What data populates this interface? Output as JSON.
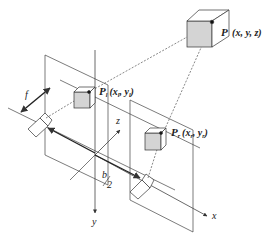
{
  "diagram": {
    "point": {
      "name": "P",
      "coords": "(x, y, z)"
    },
    "left_image_point": {
      "name": "P",
      "sub": "l",
      "coords_open": "(x",
      "coords_mid": ", y",
      "coords_close": ")",
      "sub_x": "l",
      "sub_y": "l"
    },
    "right_image_point": {
      "name": "P",
      "sub": "r",
      "coords_open": "(x",
      "coords_mid": ", y",
      "coords_close": ")",
      "sub_x": "r",
      "sub_y": "r"
    },
    "labels": {
      "focal": "f",
      "baseline_num": "b",
      "baseline_den": "2",
      "axis_x": "x",
      "axis_y": "y",
      "axis_z": "z"
    },
    "colors": {
      "line": "#333333",
      "cube_face": "#d4d4d4",
      "background": "#ffffff"
    }
  }
}
